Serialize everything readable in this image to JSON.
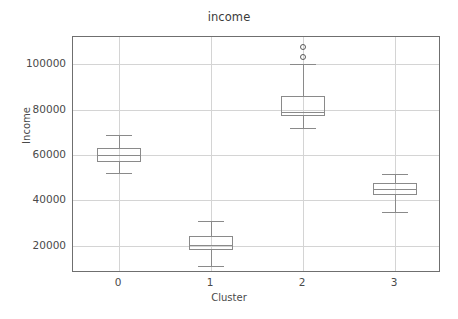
{
  "chart_data": {
    "type": "box",
    "title": "income",
    "xlabel": "Cluster",
    "ylabel": "Income",
    "categories": [
      "0",
      "1",
      "2",
      "3"
    ],
    "ytick_labels": [
      "20000",
      "40000",
      "60000",
      "80000",
      "100000"
    ],
    "ytick_values": [
      20000,
      40000,
      60000,
      80000,
      100000
    ],
    "ylim": [
      8000,
      112000
    ],
    "xlim": [
      -0.5,
      3.5
    ],
    "grid": true,
    "legend": "none",
    "boxes": [
      {
        "category": "0",
        "whisker_low": 52000,
        "q1": 57000,
        "median": 60000,
        "q3": 63000,
        "whisker_high": 69000,
        "outliers": []
      },
      {
        "category": "1",
        "whisker_low": 11000,
        "q1": 18000,
        "median": 20500,
        "q3": 24500,
        "whisker_high": 31000,
        "outliers": []
      },
      {
        "category": "2",
        "whisker_low": 72000,
        "q1": 77000,
        "median": 79000,
        "q3": 86000,
        "whisker_high": 100000,
        "outliers": [
          103000,
          107500
        ]
      },
      {
        "category": "3",
        "whisker_low": 35000,
        "q1": 42500,
        "median": 45000,
        "q3": 47500,
        "whisker_high": 51500,
        "outliers": []
      }
    ],
    "colors": {
      "box_edge": "#8a8a8a",
      "median_line": "#8a8a8a",
      "whisker": "#8a8a8a",
      "grid": "#d4d4d4",
      "axis": "#6f6f6f",
      "text": "#4a4a4a",
      "background": "#ffffff"
    }
  }
}
